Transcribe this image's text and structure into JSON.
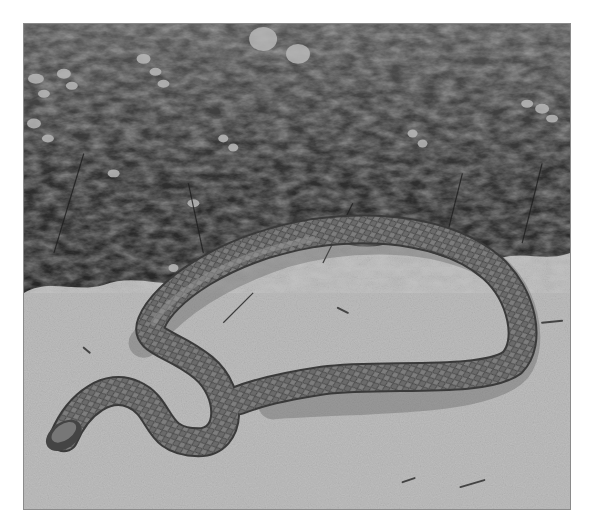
{
  "image": {
    "kind": "photograph",
    "color_mode": "grayscale",
    "subject": "snake coiled on sandy ground",
    "background": "heather shrubs with flower clusters",
    "foreground": "speckled sand",
    "frame": {
      "border_color": "#8a8a8a",
      "page_background": "#ffffff"
    },
    "palette": {
      "sand_light": "#d9d9d9",
      "sand_mid": "#bdbdbd",
      "foliage_dark": "#2a2a2a",
      "foliage_mid": "#4e4e4e",
      "flower_light": "#b8b8b8",
      "snake_body": "#6a6a6a",
      "snake_dark": "#3a3a3a",
      "shadow": "#5a5a5a"
    }
  }
}
